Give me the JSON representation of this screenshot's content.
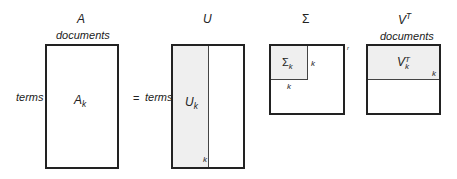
{
  "matrices": {
    "A": {
      "title": "A",
      "top_label": "documents",
      "side_label": "terms",
      "inner_label": "A",
      "inner_sub": "k"
    },
    "U": {
      "title": "U",
      "side_label": "terms",
      "inner_label": "U",
      "inner_sub": "k",
      "dim_label": "k"
    },
    "Sigma": {
      "title": "Σ",
      "inner_label": "Σ",
      "inner_sub": "k",
      "dim_right": "k",
      "dim_bottom": "k",
      "corner_label": "r"
    },
    "VT": {
      "title": "V",
      "title_sup": "T",
      "top_label": "documents",
      "inner_label": "V",
      "inner_sub": "k",
      "inner_sup": "T",
      "dim_label": "k"
    }
  },
  "equals_sign": "="
}
